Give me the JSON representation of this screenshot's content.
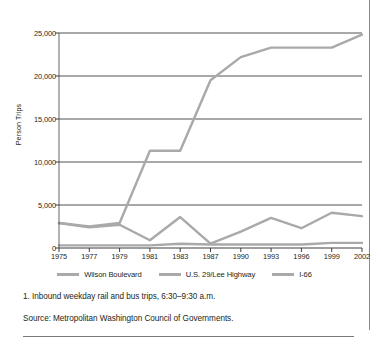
{
  "chart_data": {
    "type": "line",
    "title": "",
    "xlabel": "",
    "ylabel": "Person Trips",
    "categories": [
      "1975",
      "1977",
      "1979",
      "1981",
      "1983",
      "1987",
      "1990",
      "1993",
      "1996",
      "1999",
      "2002"
    ],
    "ylim": [
      0,
      25000
    ],
    "yticks": [
      0,
      5000,
      10000,
      15000,
      20000,
      25000
    ],
    "ytick_labels": [
      "0",
      "5,000",
      "10,000",
      "15,000",
      "20,000",
      "25,000"
    ],
    "grid": "horizontal",
    "legend_position": "bottom",
    "series": [
      {
        "name": "Wilson Boulevard",
        "color": "#a9a9a9",
        "values": [
          2900,
          2500,
          2900,
          11300,
          11300,
          19500,
          22200,
          23300,
          23300,
          23300,
          24800
        ]
      },
      {
        "name": "U.S. 29/Lee Highway",
        "color": "#a9a9a9",
        "values": [
          2900,
          2400,
          2700,
          900,
          3600,
          500,
          1900,
          3500,
          2300,
          4100,
          3700
        ]
      },
      {
        "name": "I-66",
        "color": "#a9a9a9",
        "values": [
          300,
          300,
          300,
          300,
          500,
          400,
          400,
          400,
          400,
          600,
          600
        ]
      }
    ]
  },
  "notes": {
    "footnote": "1. Inbound weekday rail and bus trips, 6:30–9:30 a.m.",
    "source": "Source: Metropolitan Washington Council of Governments."
  },
  "colors": {
    "series_line": "#a9a9a9",
    "gridline": "#3f3f3f",
    "axis": "#3f3f3f",
    "text": "#231f20",
    "rule": "#7a7a7a"
  }
}
